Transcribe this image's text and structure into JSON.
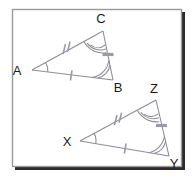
{
  "figure": {
    "frame": {
      "x": 12,
      "y": 9,
      "width": 170,
      "height": 158,
      "border_color": "#9a9a9a",
      "shadow_color": "#2b2b2b",
      "fill_color": "#ffffff"
    },
    "stroke_color": "#8d8d99",
    "mark_color": "#9a9aa6",
    "label_color": "#1a1a1a"
  },
  "triangles": [
    {
      "name": "triangle-abc",
      "vertices": [
        {
          "label": "A",
          "point_x": 32,
          "point_y": 70,
          "label_x": 17,
          "label_y": 75,
          "angle_arcs": 1
        },
        {
          "label": "B",
          "point_x": 113,
          "point_y": 80,
          "label_x": 116,
          "label_y": 92,
          "angle_arcs": 2
        },
        {
          "label": "C",
          "point_x": 103,
          "point_y": 31,
          "label_x": 98,
          "label_y": 23,
          "angle_arcs": 3
        }
      ],
      "sides": [
        {
          "name": "side-ab",
          "from": "A",
          "to": "B",
          "ticks": 1,
          "tick_style": "slash"
        },
        {
          "name": "side-ac",
          "from": "A",
          "to": "C",
          "ticks": 2,
          "tick_style": "slash"
        },
        {
          "name": "side-cb",
          "from": "C",
          "to": "B",
          "ticks": 1,
          "tick_style": "bar"
        }
      ]
    },
    {
      "name": "triangle-xyz",
      "vertices": [
        {
          "label": "X",
          "point_x": 80,
          "point_y": 141,
          "label_x": 65,
          "label_y": 146,
          "angle_arcs": 1
        },
        {
          "label": "Y",
          "point_x": 169,
          "point_y": 156,
          "label_x": 171,
          "label_y": 168,
          "angle_arcs": 2
        },
        {
          "label": "Z",
          "point_x": 156,
          "point_y": 100,
          "label_x": 151,
          "label_y": 92,
          "angle_arcs": 3
        }
      ],
      "sides": [
        {
          "name": "side-xy",
          "from": "X",
          "to": "Y",
          "ticks": 1,
          "tick_style": "slash"
        },
        {
          "name": "side-xz",
          "from": "X",
          "to": "Z",
          "ticks": 2,
          "tick_style": "slash"
        },
        {
          "name": "side-zy",
          "from": "Z",
          "to": "Y",
          "ticks": 1,
          "tick_style": "bar"
        }
      ]
    }
  ]
}
